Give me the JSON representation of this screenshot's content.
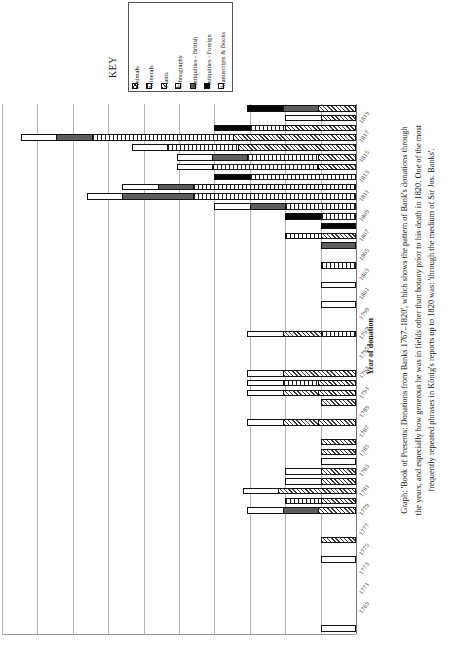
{
  "key": {
    "title": "KEY",
    "items": [
      {
        "label": "Animals",
        "swatch": "crosshatch-swatch",
        "color": "#ffffff"
      },
      {
        "label": "Minerals",
        "swatch": "vertical-stripe-swatch",
        "color": "#ffffff"
      },
      {
        "label": "Plants",
        "swatch": "diagonal-hatch-swatch",
        "color": "#ffffff"
      },
      {
        "label": "Ethnography",
        "swatch": "horizontal-line-swatch",
        "color": "#ffffff"
      },
      {
        "label": "Antiquities - British",
        "swatch": "dark-grey-swatch",
        "color": "#5e5e5e"
      },
      {
        "label": "Antiquities - Foreign",
        "swatch": "black-swatch",
        "color": "#070707"
      },
      {
        "label": "Manuscripts & Books",
        "swatch": "white-swatch",
        "color": "#ffffff"
      }
    ]
  },
  "axis": {
    "category_title": "Year of donation"
  },
  "caption": {
    "line1": "Graph: 'Book of Presents: Donations from Banks 1767–1820', which shows the pattern of Bank's donations through",
    "line2": "the years, and especially how generous he was in fields other than botany prior to his death in 1820. One of the most",
    "line3": "frequently repeated phrases in König's reports up to 1820 was: 'through the medium of Sir Jos. Banks'."
  },
  "chart_data": {
    "type": "bar",
    "orientation": "horizontal-stacked",
    "title": "Book of Presents: Donations from Banks 1767–1820",
    "xlabel": "",
    "ylabel": "Year of donation",
    "grid": true,
    "legend_position": "top",
    "note": "Bars are stacked horizontally and grow leftward from the right-hand baseline. Values are in grid units (1 unit = one gridline interval, 10 intervals across the plot).",
    "xlim": [
      0,
      10
    ],
    "series": [
      {
        "name": "Animals"
      },
      {
        "name": "Minerals"
      },
      {
        "name": "Plants"
      },
      {
        "name": "Ethnography"
      },
      {
        "name": "Antiquities - British"
      },
      {
        "name": "Antiquities - Foreign"
      },
      {
        "name": "Manuscripts & Books"
      }
    ],
    "categories": [
      "1820",
      "1819",
      "1818",
      "1817",
      "1816",
      "1815",
      "1814",
      "1813",
      "1812",
      "1811",
      "1810",
      "1809",
      "1808",
      "1807",
      "1806",
      "1805",
      "1804",
      "1803",
      "1802",
      "1801",
      "1800",
      "1799",
      "1798",
      "1797",
      "1796",
      "1795",
      "1794",
      "1793",
      "1792",
      "1791",
      "1790",
      "1789",
      "1788",
      "1787",
      "1786",
      "1785",
      "1784",
      "1783",
      "1782",
      "1781",
      "1780",
      "1779",
      "1778",
      "1777",
      "1776",
      "1775",
      "1774",
      "1773",
      "1772",
      "1771",
      "1770",
      "1769",
      "1768",
      "1767"
    ],
    "bars": [
      {
        "year": "1820",
        "segments": [
          {
            "s": "Plants",
            "v": 3.2
          },
          {
            "s": "Antiquities - British",
            "v": 3.0
          },
          {
            "s": "Antiquities - Foreign",
            "v": 3.0
          }
        ]
      },
      {
        "year": "1819",
        "segments": [
          {
            "s": "Plants",
            "v": 3.0
          },
          {
            "s": "Manuscripts & Books",
            "v": 3.0
          }
        ]
      },
      {
        "year": "1818",
        "segments": [
          {
            "s": "Plants",
            "v": 6.0
          },
          {
            "s": "Minerals",
            "v": 3.0
          },
          {
            "s": "Antiquities - Foreign",
            "v": 3.0
          }
        ]
      },
      {
        "year": "1817",
        "segments": [
          {
            "s": "Plants",
            "v": 10.4
          },
          {
            "s": "Minerals",
            "v": 12.0
          },
          {
            "s": "Antiquities - British",
            "v": 3.0
          },
          {
            "s": "Manuscripts & Books",
            "v": 3.0
          }
        ]
      },
      {
        "year": "1816",
        "segments": [
          {
            "s": "Plants",
            "v": 10.0
          },
          {
            "s": "Minerals",
            "v": 6.0
          },
          {
            "s": "Manuscripts & Books",
            "v": 3.0
          }
        ]
      },
      {
        "year": "1815",
        "segments": [
          {
            "s": "Plants",
            "v": 3.2
          },
          {
            "s": "Minerals",
            "v": 6.0
          },
          {
            "s": "Antiquities - British",
            "v": 3.0
          },
          {
            "s": "Manuscripts & Books",
            "v": 3.0
          }
        ]
      },
      {
        "year": "1814",
        "segments": [
          {
            "s": "Plants",
            "v": 3.2
          },
          {
            "s": "Minerals",
            "v": 9.0
          },
          {
            "s": "Manuscripts & Books",
            "v": 3.0
          }
        ]
      },
      {
        "year": "1813",
        "segments": [
          {
            "s": "Minerals",
            "v": 9.0
          },
          {
            "s": "Antiquities - Foreign",
            "v": 3.0
          }
        ]
      },
      {
        "year": "1812",
        "segments": [
          {
            "s": "Minerals",
            "v": 13.8
          },
          {
            "s": "Antiquities - British",
            "v": 3.0
          },
          {
            "s": "Manuscripts & Books",
            "v": 3.0
          }
        ]
      },
      {
        "year": "1811",
        "segments": [
          {
            "s": "Minerals",
            "v": 13.8
          },
          {
            "s": "Antiquities - British",
            "v": 6.0
          },
          {
            "s": "Manuscripts & Books",
            "v": 3.0
          }
        ]
      },
      {
        "year": "1810",
        "segments": [
          {
            "s": "Minerals",
            "v": 6.0
          },
          {
            "s": "Antiquities - British",
            "v": 3.0
          },
          {
            "s": "Manuscripts & Books",
            "v": 3.0
          }
        ]
      },
      {
        "year": "1809",
        "segments": [
          {
            "s": "Minerals",
            "v": 3.0
          },
          {
            "s": "Antiquities - Foreign",
            "v": 3.0
          }
        ]
      },
      {
        "year": "1808",
        "segments": [
          {
            "s": "Antiquities - Foreign",
            "v": 3.0
          }
        ]
      },
      {
        "year": "1807",
        "segments": [
          {
            "s": "Plants",
            "v": 3.0
          },
          {
            "s": "Minerals",
            "v": 3.0
          }
        ]
      },
      {
        "year": "1806",
        "segments": [
          {
            "s": "Antiquities - British",
            "v": 3.0
          }
        ]
      },
      {
        "year": "1805",
        "segments": []
      },
      {
        "year": "1804",
        "segments": [
          {
            "s": "Minerals",
            "v": 3.0
          }
        ]
      },
      {
        "year": "1803",
        "segments": []
      },
      {
        "year": "1802",
        "segments": [
          {
            "s": "Manuscripts & Books",
            "v": 3.0
          }
        ]
      },
      {
        "year": "1801",
        "segments": []
      },
      {
        "year": "1800",
        "segments": [
          {
            "s": "Manuscripts & Books",
            "v": 3.0
          }
        ]
      },
      {
        "year": "1799",
        "segments": []
      },
      {
        "year": "1798",
        "segments": []
      },
      {
        "year": "1797",
        "segments": [
          {
            "s": "Minerals",
            "v": 3.0
          },
          {
            "s": "Plants",
            "v": 3.2
          },
          {
            "s": "Manuscripts & Books",
            "v": 3.0
          }
        ]
      },
      {
        "year": "1796",
        "segments": []
      },
      {
        "year": "1795",
        "segments": []
      },
      {
        "year": "1794",
        "segments": []
      },
      {
        "year": "1793",
        "segments": [
          {
            "s": "Plants",
            "v": 6.2
          },
          {
            "s": "Manuscripts & Books",
            "v": 3.0
          }
        ]
      },
      {
        "year": "1792",
        "segments": [
          {
            "s": "Plants",
            "v": 3.2
          },
          {
            "s": "Minerals",
            "v": 3.0
          },
          {
            "s": "Manuscripts & Books",
            "v": 3.0
          }
        ]
      },
      {
        "year": "1791",
        "segments": [
          {
            "s": "Plants",
            "v": 3.2
          },
          {
            "s": "Plants",
            "v": 3.0
          },
          {
            "s": "Manuscripts & Books",
            "v": 3.0
          }
        ]
      },
      {
        "year": "1790",
        "segments": [
          {
            "s": "Plants",
            "v": 3.0
          }
        ]
      },
      {
        "year": "1789",
        "segments": []
      },
      {
        "year": "1788",
        "segments": [
          {
            "s": "Plants",
            "v": 3.2
          },
          {
            "s": "Plants",
            "v": 3.0
          },
          {
            "s": "Manuscripts & Books",
            "v": 3.0
          }
        ]
      },
      {
        "year": "1787",
        "segments": []
      },
      {
        "year": "1786",
        "segments": [
          {
            "s": "Plants",
            "v": 3.0
          }
        ]
      },
      {
        "year": "1785",
        "segments": [
          {
            "s": "Plants",
            "v": 3.0
          }
        ]
      },
      {
        "year": "1784",
        "segments": [
          {
            "s": "Manuscripts & Books",
            "v": 3.0
          }
        ]
      },
      {
        "year": "1783",
        "segments": [
          {
            "s": "Plants",
            "v": 3.0
          },
          {
            "s": "Manuscripts & Books",
            "v": 3.0
          }
        ]
      },
      {
        "year": "1782",
        "segments": [
          {
            "s": "Plants",
            "v": 3.0
          },
          {
            "s": "Manuscripts & Books",
            "v": 3.0
          }
        ]
      },
      {
        "year": "1781",
        "segments": [
          {
            "s": "Plants",
            "v": 6.6
          },
          {
            "s": "Manuscripts & Books",
            "v": 3.0
          }
        ]
      },
      {
        "year": "1780",
        "segments": [
          {
            "s": "Plants",
            "v": 3.0
          },
          {
            "s": "Minerals",
            "v": 3.0
          }
        ]
      },
      {
        "year": "1779",
        "segments": [
          {
            "s": "Plants",
            "v": 3.2
          },
          {
            "s": "Antiquities - British",
            "v": 3.0
          },
          {
            "s": "Manuscripts & Books",
            "v": 3.0
          }
        ]
      },
      {
        "year": "1778",
        "segments": []
      },
      {
        "year": "1777",
        "segments": []
      },
      {
        "year": "1776",
        "segments": [
          {
            "s": "Plants",
            "v": 3.0
          }
        ]
      },
      {
        "year": "1775",
        "segments": []
      },
      {
        "year": "1774",
        "segments": [
          {
            "s": "Manuscripts & Books",
            "v": 3.0
          }
        ]
      },
      {
        "year": "1773",
        "segments": []
      },
      {
        "year": "1772",
        "segments": []
      },
      {
        "year": "1771",
        "segments": []
      },
      {
        "year": "1770",
        "segments": []
      },
      {
        "year": "1769",
        "segments": []
      },
      {
        "year": "1768",
        "segments": []
      },
      {
        "year": "1767",
        "segments": [
          {
            "s": "Manuscripts & Books",
            "v": 3.0
          }
        ]
      }
    ],
    "tick_labels": [
      "1819",
      "1817",
      "1815",
      "1813",
      "1811",
      "1809",
      "1807",
      "1805",
      "1803",
      "1801",
      "1799",
      "1797",
      "1795",
      "1793",
      "1791",
      "1789",
      "1787",
      "1785",
      "1783",
      "1781",
      "1779",
      "1777",
      "1775",
      "1773",
      "1771",
      "1769"
    ]
  }
}
